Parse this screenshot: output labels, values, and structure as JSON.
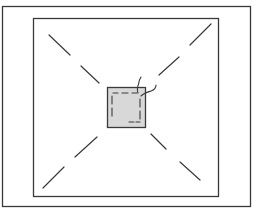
{
  "diagram": {
    "type": "technical-illustration",
    "colors": {
      "background": "#ffffff",
      "stroke": "#3a3a3a",
      "patch_fill": "#d8d8d8"
    },
    "outer_frame": {
      "x": 2,
      "y": 6,
      "width": 249,
      "height": 201
    },
    "inner_frame": {
      "x": 33,
      "y": 18,
      "width": 186,
      "height": 179
    },
    "patch": {
      "x": 107,
      "y": 87,
      "width": 38,
      "height": 40
    },
    "guide_lines": [
      {
        "name": "top-left",
        "segments": [
          [
            49,
            35,
            70,
            55
          ],
          [
            81,
            66,
            99,
            83
          ]
        ]
      },
      {
        "name": "top-right",
        "segments": [
          [
            211,
            24,
            190,
            45
          ],
          [
            179,
            57,
            159,
            75
          ]
        ]
      },
      {
        "name": "bottom-left",
        "segments": [
          [
            43,
            188,
            64,
            167
          ],
          [
            75,
            157,
            97,
            137
          ]
        ]
      },
      {
        "name": "bottom-right",
        "segments": [
          [
            151,
            134,
            166,
            149
          ],
          [
            180,
            162,
            200,
            180
          ]
        ]
      }
    ],
    "threads": 2
  }
}
